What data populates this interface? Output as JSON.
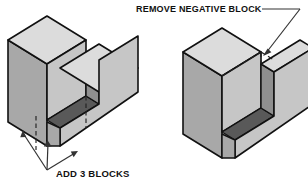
{
  "figure": {
    "type": "isometric-technical-diagram",
    "background_color": "#ffffff",
    "line_color": "#111111"
  },
  "colors": {
    "top_face": "#dcdcdc",
    "left_face": "#a8a8a8",
    "right_face": "#c6c6c6",
    "front_face": "#c2c2c2",
    "notch_floor": "#595959",
    "notch_wall": "#8f8f8f",
    "outline": "#111111",
    "hidden_line": "#222222",
    "leader_line": "#333333",
    "text": "#111111"
  },
  "left_figure": {
    "name": "additive-u-block",
    "caption": "ADD 3 BLOCKS",
    "annotation_style": "three converging arrows to base subdivisions",
    "arrow_count": 3,
    "hidden_lines": "two vertical dashed lines dividing base into 3 blocks",
    "shape": "U-shaped block, tall left prong, short right prong"
  },
  "right_figure": {
    "name": "subtractive-u-block",
    "caption": "REMOVE NEGATIVE BLOCK",
    "annotation_style": "single leader line with arrowhead to dashed notch outline",
    "arrow_count": 1,
    "hidden_lines": "dashed outline of removed rectangular negative block",
    "shape": "U-shaped block, tall left prong, short right prong"
  },
  "geometry_notes": {
    "projection": "isometric",
    "left_face_angle_deg": 30,
    "right_face_angle_deg": 30
  }
}
